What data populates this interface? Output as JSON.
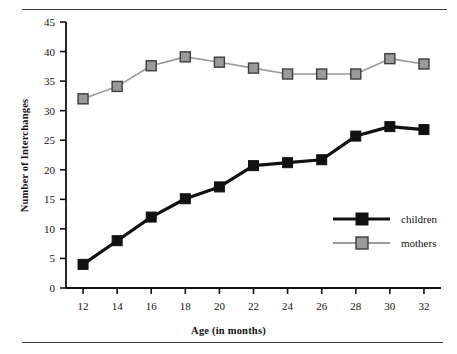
{
  "figure": {
    "top_rule": "horizontal-rule",
    "bottom_rule": "horizontal-rule"
  },
  "chart_data": {
    "type": "line",
    "title": "",
    "xlabel": "Age (in months)",
    "ylabel": "Number of Interchanges",
    "categories": [
      12,
      14,
      16,
      18,
      20,
      22,
      24,
      26,
      28,
      30,
      32
    ],
    "x": [
      12,
      14,
      16,
      18,
      20,
      22,
      24,
      26,
      28,
      30,
      32
    ],
    "xlim": [
      11,
      33
    ],
    "ylim": [
      0,
      45
    ],
    "xticks": [
      "12",
      "14",
      "16",
      "18",
      "20",
      "22",
      "24",
      "26",
      "28",
      "30",
      "32"
    ],
    "yticks": [
      "0",
      "5",
      "10",
      "15",
      "20",
      "25",
      "30",
      "35",
      "40",
      "45"
    ],
    "ytick_values": [
      0,
      5,
      10,
      15,
      20,
      25,
      30,
      35,
      40,
      45
    ],
    "grid": false,
    "legend_position": "center-right",
    "series": [
      {
        "name": "children",
        "color": "#111111",
        "line_width": 3.2,
        "marker": "square-filled",
        "values": [
          4.0,
          8.0,
          12.0,
          15.1,
          17.1,
          20.7,
          21.2,
          21.7,
          25.7,
          27.3,
          26.8
        ]
      },
      {
        "name": "mothers",
        "color": "#9a9a9a",
        "line_width": 1.6,
        "marker": "square-gray",
        "values": [
          32.0,
          34.1,
          37.6,
          39.1,
          38.2,
          37.2,
          36.2,
          36.2,
          36.2,
          38.8,
          37.9
        ]
      }
    ]
  },
  "legend": {
    "entries": [
      {
        "label": "children"
      },
      {
        "label": "mothers"
      }
    ]
  }
}
